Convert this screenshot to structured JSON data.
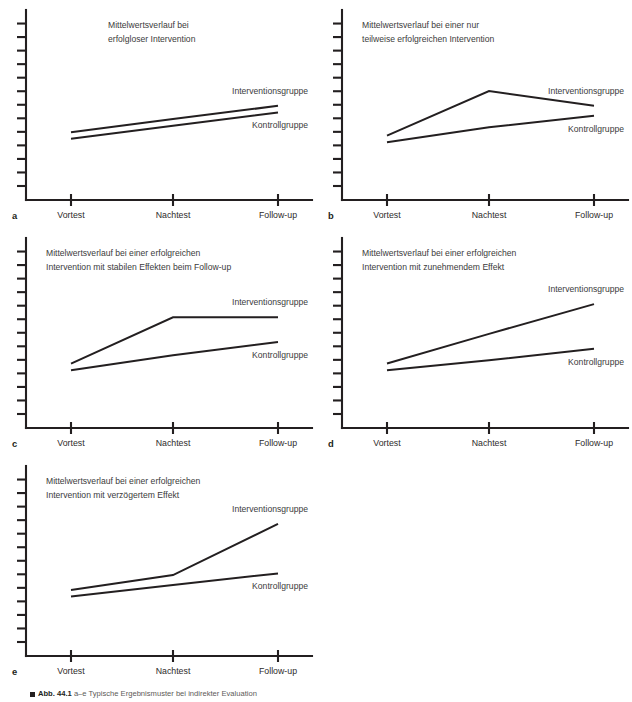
{
  "figure": {
    "caption_label": "Abb. 44.1",
    "caption_text": "a–e Typische Ergebnismuster bei indirekter Evaluation",
    "axis_color": "#231f20",
    "text_color": "#3b3b3b"
  },
  "common": {
    "x_categories": [
      "Vortest",
      "Nachtest",
      "Follow-up"
    ],
    "series_names": [
      "Interventionsgruppe",
      "Kontrollgruppe"
    ],
    "label_intervention": "Interventionsgruppe",
    "label_control": "Kontrollgruppe"
  },
  "chart_data": [
    {
      "id": "a",
      "type": "line",
      "panel_letter": "a",
      "title": "Mittelwertsverlauf bei erfolgloser Intervention",
      "title_lines": [
        "Mittelwertsverlauf bei",
        "erfolgloser Intervention"
      ],
      "xlabel": "",
      "ylabel": "",
      "categories": [
        "Vortest",
        "Nachtest",
        "Follow-up"
      ],
      "ylim": [
        0,
        10
      ],
      "grid": false,
      "y_ticks": 13,
      "legend": "inline-right",
      "series": [
        {
          "name": "Interventionsgruppe",
          "values": [
            3.5,
            4.3,
            5.1
          ]
        },
        {
          "name": "Kontrollgruppe",
          "values": [
            3.1,
            3.9,
            4.7
          ]
        }
      ]
    },
    {
      "id": "b",
      "type": "line",
      "panel_letter": "b",
      "title": "Mittelwertsverlauf bei einer nur teilweise erfolgreichen Intervention",
      "title_lines": [
        "Mittelwertsverlauf bei einer nur",
        "teilweise erfolgreichen Intervention"
      ],
      "xlabel": "",
      "ylabel": "",
      "categories": [
        "Vortest",
        "Nachtest",
        "Follow-up"
      ],
      "ylim": [
        0,
        10
      ],
      "grid": false,
      "y_ticks": 13,
      "legend": "inline-right",
      "series": [
        {
          "name": "Interventionsgruppe",
          "values": [
            3.3,
            6.0,
            5.1
          ]
        },
        {
          "name": "Kontrollgruppe",
          "values": [
            2.9,
            3.8,
            4.5
          ]
        }
      ]
    },
    {
      "id": "c",
      "type": "line",
      "panel_letter": "c",
      "title": "Mittelwertsverlauf bei einer erfolgreichen Intervention mit stabilen Effekten beim Follow-up",
      "title_lines": [
        "Mittelwertsverlauf bei einer erfolgreichen",
        "Intervention mit stabilen Effekten beim Follow-up"
      ],
      "xlabel": "",
      "ylabel": "",
      "categories": [
        "Vortest",
        "Nachtest",
        "Follow-up"
      ],
      "ylim": [
        0,
        10
      ],
      "grid": false,
      "y_ticks": 13,
      "legend": "inline-right",
      "series": [
        {
          "name": "Interventionsgruppe",
          "values": [
            3.3,
            6.1,
            6.1
          ]
        },
        {
          "name": "Kontrollgruppe",
          "values": [
            2.9,
            3.8,
            4.6
          ]
        }
      ]
    },
    {
      "id": "d",
      "type": "line",
      "panel_letter": "d",
      "title": "Mittelwertsverlauf bei einer erfolgreichen Intervention mit zunehmendem Effekt",
      "title_lines": [
        "Mittelwertsverlauf bei einer erfolgreichen",
        "Intervention mit zunehmendem Effekt"
      ],
      "xlabel": "",
      "ylabel": "",
      "categories": [
        "Vortest",
        "Nachtest",
        "Follow-up"
      ],
      "ylim": [
        0,
        10
      ],
      "grid": false,
      "y_ticks": 13,
      "legend": "inline-right",
      "series": [
        {
          "name": "Interventionsgruppe",
          "values": [
            3.3,
            5.1,
            6.9
          ]
        },
        {
          "name": "Kontrollgruppe",
          "values": [
            2.9,
            3.5,
            4.2
          ]
        }
      ]
    },
    {
      "id": "e",
      "type": "line",
      "panel_letter": "e",
      "title": "Mittelwertsverlauf bei einer erfolgreichen Intervention mit verzögertem Effekt",
      "title_lines": [
        "Mittelwertsverlauf bei einer erfolgreichen",
        "Intervention mit verzögertem Effekt"
      ],
      "xlabel": "",
      "ylabel": "",
      "categories": [
        "Vortest",
        "Nachtest",
        "Follow-up"
      ],
      "ylim": [
        0,
        10
      ],
      "grid": false,
      "y_ticks": 13,
      "legend": "inline-right",
      "series": [
        {
          "name": "Interventionsgruppe",
          "values": [
            3.4,
            4.3,
            7.4
          ]
        },
        {
          "name": "Kontrollgruppe",
          "values": [
            3.0,
            3.7,
            4.4
          ]
        }
      ]
    }
  ]
}
